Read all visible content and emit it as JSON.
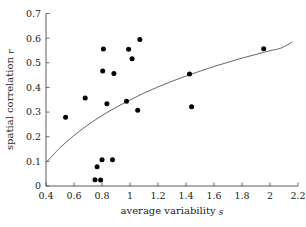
{
  "chart_data": {
    "type": "scatter",
    "title": "",
    "xlabel": "average variability s",
    "xlabel_main": "average variability",
    "xlabel_symbol": "s",
    "ylabel": "spatial correlation r",
    "ylabel_main": "spatial correlation",
    "ylabel_symbol": "r",
    "xlim": [
      0.4,
      2.2
    ],
    "ylim": [
      0.0,
      0.7
    ],
    "xticks": [
      0.4,
      0.6,
      0.8,
      1.0,
      1.2,
      1.4,
      1.6,
      1.8,
      2.0,
      2.2
    ],
    "xtick_labels": [
      "0.4",
      "0.6",
      "0.8",
      "1",
      "1.2",
      "1.4",
      "1.6",
      "1.8",
      "2",
      "2.2"
    ],
    "yticks": [
      0.0,
      0.1,
      0.2,
      0.3,
      0.4,
      0.5,
      0.6,
      0.7
    ],
    "ytick_labels": [
      "0",
      "0.1",
      "0.2",
      "0.3",
      "0.4",
      "0.5",
      "0.6",
      "0.7"
    ],
    "grid": false,
    "legend": false,
    "point_color": "#000000",
    "curve_color": "#555555",
    "axis_color": "#4a4a4a",
    "points": [
      {
        "x": 0.54,
        "y": 0.279
      },
      {
        "x": 0.68,
        "y": 0.357
      },
      {
        "x": 0.75,
        "y": 0.025
      },
      {
        "x": 0.765,
        "y": 0.078
      },
      {
        "x": 0.79,
        "y": 0.024
      },
      {
        "x": 0.8,
        "y": 0.107
      },
      {
        "x": 0.805,
        "y": 0.467
      },
      {
        "x": 0.81,
        "y": 0.556
      },
      {
        "x": 0.835,
        "y": 0.334
      },
      {
        "x": 0.875,
        "y": 0.107
      },
      {
        "x": 0.885,
        "y": 0.457
      },
      {
        "x": 0.975,
        "y": 0.344
      },
      {
        "x": 0.99,
        "y": 0.555
      },
      {
        "x": 1.015,
        "y": 0.516
      },
      {
        "x": 1.055,
        "y": 0.307
      },
      {
        "x": 1.07,
        "y": 0.595
      },
      {
        "x": 1.425,
        "y": 0.455
      },
      {
        "x": 1.44,
        "y": 0.322
      },
      {
        "x": 1.955,
        "y": 0.557
      }
    ],
    "curve": {
      "description": "monotonic increasing fitted curve (logarithmic-like)",
      "x_start": 0.4,
      "y_start": 0.095,
      "x_end": 2.16,
      "y_end": 0.585,
      "points": [
        {
          "x": 0.4,
          "y": 0.095
        },
        {
          "x": 0.5,
          "y": 0.155
        },
        {
          "x": 0.6,
          "y": 0.205
        },
        {
          "x": 0.7,
          "y": 0.248
        },
        {
          "x": 0.8,
          "y": 0.286
        },
        {
          "x": 0.9,
          "y": 0.319
        },
        {
          "x": 1.0,
          "y": 0.349
        },
        {
          "x": 1.1,
          "y": 0.377
        },
        {
          "x": 1.2,
          "y": 0.402
        },
        {
          "x": 1.3,
          "y": 0.425
        },
        {
          "x": 1.4,
          "y": 0.446
        },
        {
          "x": 1.5,
          "y": 0.466
        },
        {
          "x": 1.6,
          "y": 0.485
        },
        {
          "x": 1.7,
          "y": 0.502
        },
        {
          "x": 1.8,
          "y": 0.519
        },
        {
          "x": 1.9,
          "y": 0.534
        },
        {
          "x": 2.0,
          "y": 0.549
        },
        {
          "x": 2.08,
          "y": 0.56
        },
        {
          "x": 2.16,
          "y": 0.585
        }
      ]
    }
  }
}
